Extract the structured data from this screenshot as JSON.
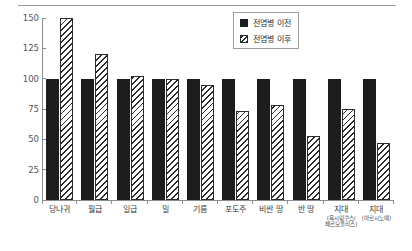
{
  "chart_data": {
    "type": "bar",
    "title": "",
    "xlabel": "",
    "ylabel": "",
    "ylim": [
      0,
      150
    ],
    "yticks": [
      0,
      25,
      50,
      75,
      100,
      125,
      150
    ],
    "grid": false,
    "legend_position": "top-right",
    "categories": [
      "당나귀",
      "월급",
      "일급",
      "밀",
      "기름",
      "포도주",
      "비싼 땅",
      "반 땅",
      "지대",
      "지대"
    ],
    "category_subnotes": [
      "",
      "",
      "",
      "",
      "",
      "",
      "",
      "",
      "(옥시링쿠스/ 헤르모폴리스)",
      "(아르시노에)"
    ],
    "series": [
      {
        "name": "전염병 이전",
        "values": [
          100,
          100,
          100,
          100,
          100,
          100,
          100,
          100,
          100,
          100
        ]
      },
      {
        "name": "전염병 이후",
        "values": [
          150,
          120,
          102,
          100,
          95,
          73,
          78,
          53,
          75,
          47
        ]
      }
    ]
  },
  "legend": {
    "items": [
      {
        "label": "전염병 이전",
        "swatch": "solid-black"
      },
      {
        "label": "전염병 이후",
        "swatch": "diagonal-hatch"
      }
    ]
  },
  "axes": {
    "y_tick_labels": [
      "150",
      "125",
      "100",
      "75",
      "50",
      "25",
      "0"
    ]
  }
}
